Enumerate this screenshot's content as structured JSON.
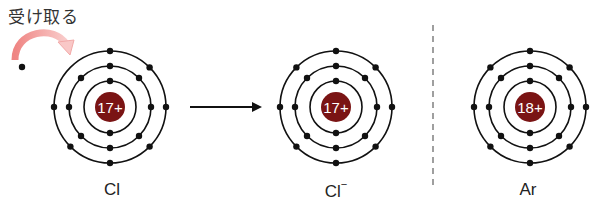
{
  "caption": "受け取る",
  "colors": {
    "nucleus": "#7a1414",
    "orbit": "#111111",
    "electron": "#111111",
    "arrow_curve_start": "#f08a88",
    "arrow_curve_end": "#f8c4c4",
    "divider": "#888888"
  },
  "atoms": [
    {
      "id": "cl",
      "symbol": "Cl",
      "charge_sup": "",
      "nucleus_label": "17+",
      "cx": 110,
      "cy": 107,
      "shells": [
        2,
        8,
        7
      ]
    },
    {
      "id": "cl-ion",
      "symbol": "Cl",
      "charge_sup": "−",
      "nucleus_label": "17+",
      "cx": 336,
      "cy": 107,
      "shells": [
        2,
        8,
        8
      ]
    },
    {
      "id": "ar",
      "symbol": "Ar",
      "charge_sup": "",
      "nucleus_label": "18+",
      "cx": 530,
      "cy": 107,
      "shells": [
        2,
        8,
        8
      ]
    }
  ],
  "free_electron": {
    "x": 22,
    "y": 67
  },
  "reaction_arrow": {
    "x1": 190,
    "x2": 262,
    "y": 107
  }
}
